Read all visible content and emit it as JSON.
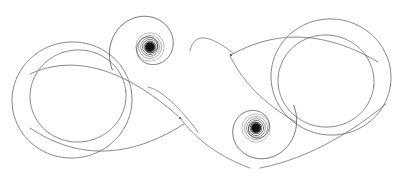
{
  "figure": {
    "domain": "Diagram",
    "kind": "phase-portrait",
    "title": "Phase portrait of a planar dynamical system",
    "canvas": {
      "width": 407,
      "height": 177
    },
    "background_color": "#ffffff",
    "stroke_color": "#6a6a6a",
    "stroke_color_dark": "#4a4a4a",
    "stroke_color_core": "#111111",
    "stroke_width": 0.85,
    "bounding_box": {
      "x_min": 12,
      "y_min": 10,
      "x_max": 392,
      "y_max": 166
    }
  },
  "equilibria": [
    {
      "name": "upper-spiral-sink",
      "label": "stable focus (upper)",
      "type": "spiral sink",
      "x": 150,
      "y": 47,
      "core_radius": 4.2,
      "core_color": "#111111",
      "halo_radii": [
        6.0,
        7.6,
        9.4,
        11.6,
        14.2
      ]
    },
    {
      "name": "lower-spiral-sink",
      "label": "stable focus (lower)",
      "type": "spiral sink",
      "x": 256,
      "y": 128,
      "core_radius": 4.2,
      "core_color": "#111111",
      "halo_radii": [
        6.0,
        7.6,
        9.4,
        11.6,
        14.2
      ]
    }
  ],
  "crossings": [
    {
      "name": "center-crossing",
      "label": "transversal self-intersection",
      "x": 180,
      "y": 118
    },
    {
      "name": "upper-right-crossing",
      "label": "transversal self-intersection",
      "x": 231,
      "y": 55
    }
  ],
  "loops": [
    {
      "name": "left-outer-loop",
      "label": "left quasi-circular loop",
      "cx": 72,
      "cy": 100,
      "rx": 60,
      "ry": 58,
      "rotation": -8
    },
    {
      "name": "left-inner-loop",
      "label": "left inner loop",
      "cx": 78,
      "cy": 96,
      "rx": 48,
      "ry": 46,
      "rotation": -6
    },
    {
      "name": "right-outer-loop",
      "label": "right quasi-circular loop",
      "cx": 331,
      "cy": 77,
      "rx": 60,
      "ry": 58,
      "rotation": 8
    },
    {
      "name": "right-inner-loop",
      "label": "right inner loop",
      "cx": 326,
      "cy": 81,
      "rx": 48,
      "ry": 46,
      "rotation": 6
    }
  ],
  "chart_data": {
    "type": "line",
    "title": "Phase portrait of a planar dynamical system",
    "subtitle": "Lemniscate orbit converging to two spiral sinks",
    "xlabel": "",
    "ylabel": "",
    "grid": false,
    "legend": "none",
    "xlim": [
      0,
      407
    ],
    "ylim": [
      177,
      0
    ],
    "annotations": [
      {
        "text": "spiral sink",
        "x": 150,
        "y": 47
      },
      {
        "text": "spiral sink",
        "x": 256,
        "y": 128
      },
      {
        "text": "self-intersection",
        "x": 180,
        "y": 118
      },
      {
        "text": "self-intersection",
        "x": 231,
        "y": 55
      }
    ],
    "series": [
      {
        "name": "left-outer-loop",
        "kind": "closed-loop",
        "center": [
          72,
          100
        ],
        "radius": 59,
        "values": []
      },
      {
        "name": "left-inner-loop",
        "kind": "closed-loop",
        "center": [
          78,
          96
        ],
        "radius": 47,
        "values": []
      },
      {
        "name": "right-outer-loop",
        "kind": "closed-loop",
        "center": [
          331,
          77
        ],
        "radius": 59,
        "values": []
      },
      {
        "name": "right-inner-loop",
        "kind": "closed-loop",
        "center": [
          326,
          81
        ],
        "radius": 47,
        "values": []
      },
      {
        "name": "upper-spiral",
        "kind": "spiral",
        "center": [
          150,
          47
        ],
        "r_start": 44,
        "r_end": 4,
        "turns": 2.15,
        "theta_start": 2.6,
        "direction": "inward-clockwise",
        "values": []
      },
      {
        "name": "lower-spiral",
        "kind": "spiral",
        "center": [
          256,
          128
        ],
        "r_start": 44,
        "r_end": 4,
        "turns": 2.15,
        "theta_start": -0.54,
        "direction": "inward-clockwise",
        "values": []
      },
      {
        "name": "crossing-strand-a",
        "kind": "arc",
        "from": [
          150,
          47
        ],
        "to": [
          256,
          128
        ],
        "values": []
      },
      {
        "name": "crossing-strand-b",
        "kind": "arc",
        "from": [
          231,
          55
        ],
        "to": [
          180,
          118
        ],
        "values": []
      }
    ]
  }
}
